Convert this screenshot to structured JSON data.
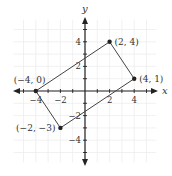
{
  "diagram": {
    "type": "coordinate-plane",
    "axes": {
      "x_label": "x",
      "y_label": "y"
    },
    "x_ticks": [
      {
        "value": -4,
        "label": "−4"
      },
      {
        "value": -2,
        "label": "−2"
      },
      {
        "value": 2,
        "label": "2"
      },
      {
        "value": 4,
        "label": "4"
      }
    ],
    "y_ticks": [
      {
        "value": 4,
        "label": "4"
      },
      {
        "value": 2,
        "label": "2"
      },
      {
        "value": -2,
        "label": "−2"
      },
      {
        "value": -4,
        "label": "−4"
      }
    ],
    "points": [
      {
        "x": -4,
        "y": 0,
        "label": "(−4, 0)"
      },
      {
        "x": 2,
        "y": 4,
        "label": "(2, 4)"
      },
      {
        "x": 4,
        "y": 1,
        "label": "(4, 1)"
      },
      {
        "x": -2,
        "y": -3,
        "label": "(−2, −3)"
      }
    ],
    "colors": {
      "grid": "#eeeeee",
      "axis": "#222222",
      "shape": "#444444",
      "point": "#222222"
    }
  }
}
